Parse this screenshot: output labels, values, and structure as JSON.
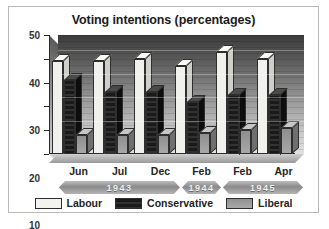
{
  "chart_data": {
    "type": "bar",
    "title": "Voting intentions (percentages)",
    "xlabel": "",
    "ylabel": "",
    "ylim": [
      0,
      50
    ],
    "yticks": [
      0,
      10,
      20,
      30,
      40,
      50
    ],
    "grid": true,
    "legend_position": "bottom",
    "categories": [
      "Jun",
      "Jul",
      "Dec",
      "Feb",
      "Feb",
      "Apr"
    ],
    "group_years": [
      "1943",
      "1943",
      "1943",
      "1944",
      "1945",
      "1945"
    ],
    "year_banners": [
      {
        "label": "1943",
        "span": 3
      },
      {
        "label": "1944",
        "span": 1
      },
      {
        "label": "1945",
        "span": 2
      }
    ],
    "series": [
      {
        "name": "Labour",
        "color": "#f0f0ec",
        "values": [
          39,
          39,
          40,
          37,
          43,
          40
        ]
      },
      {
        "name": "Conservative",
        "color": "#1a1a1a",
        "values": [
          31,
          26,
          26,
          22,
          25,
          25
        ]
      },
      {
        "name": "Liberal",
        "color": "#9a9a9a",
        "values": [
          8,
          8,
          8,
          9,
          10,
          11
        ]
      }
    ]
  },
  "legend": {
    "items": [
      {
        "label": "Labour"
      },
      {
        "label": "Conservative"
      },
      {
        "label": "Liberal"
      }
    ]
  }
}
